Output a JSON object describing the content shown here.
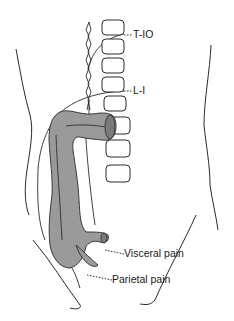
{
  "figure": {
    "colors": {
      "colon_fill": "#9a9a9a",
      "line": "#2a2a2a",
      "background": "#ffffff"
    }
  },
  "labels": {
    "t10": "T-IO",
    "l1": "L-I",
    "visceral": "Visceral pain",
    "parietal": "Parietal pain"
  }
}
